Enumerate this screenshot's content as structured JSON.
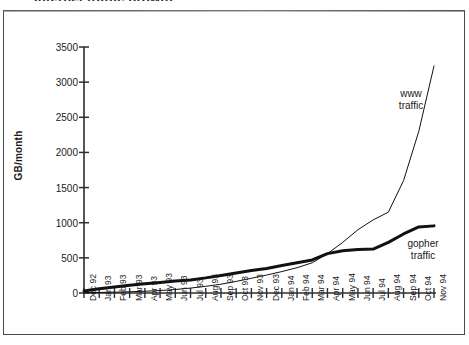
{
  "figure": {
    "clipped_caption": "Internet traffic growth",
    "frame": {
      "border_color": "#4a4a4a"
    }
  },
  "chart_data": {
    "type": "line",
    "title": "",
    "subtitle": "",
    "xlabel": "",
    "ylabel": "GB/month",
    "ylim": [
      0,
      3500
    ],
    "ytick_step": 500,
    "yticks": [
      "0",
      "500",
      "1000",
      "1500",
      "2000",
      "2500",
      "3000",
      "3500"
    ],
    "grid": false,
    "legend_position": "inline-annotations",
    "categories": [
      "Dec 92",
      "Jan 93",
      "Feb 93",
      "Mar 93",
      "Apr 93",
      "May 93",
      "Jun 93",
      "Jul 93",
      "Aug 93",
      "Sep 93",
      "Oct 93",
      "Nov 93",
      "Dec 93",
      "Jan 94",
      "Feb 94",
      "Mar 94",
      "Apr 94",
      "May 94",
      "Jun 94",
      "Jul 94",
      "Aug 94",
      "Sep 94",
      "Oct 94",
      "Nov 94"
    ],
    "series": [
      {
        "name": "gopher traffic",
        "label": "gopher\ntraffic",
        "label_line1": "gopher",
        "label_line2": "traffic",
        "color": "#111111",
        "line_width": 3,
        "values": [
          30,
          60,
          85,
          110,
          130,
          150,
          170,
          185,
          215,
          250,
          285,
          320,
          350,
          390,
          430,
          470,
          560,
          600,
          620,
          625,
          720,
          840,
          940,
          955
        ]
      },
      {
        "name": "www traffic",
        "label": "www\ntraffic",
        "label_line1": "www",
        "label_line2": "traffic",
        "color": "#111111",
        "line_width": 1,
        "values": [
          5,
          8,
          12,
          18,
          25,
          35,
          50,
          70,
          95,
          125,
          165,
          210,
          255,
          305,
          360,
          430,
          560,
          720,
          900,
          1040,
          1150,
          1600,
          2300,
          3230
        ]
      }
    ],
    "annotations": [
      {
        "text": "www traffic",
        "near": "Sep 94"
      },
      {
        "text": "gopher traffic",
        "near": "Oct 94"
      }
    ]
  }
}
